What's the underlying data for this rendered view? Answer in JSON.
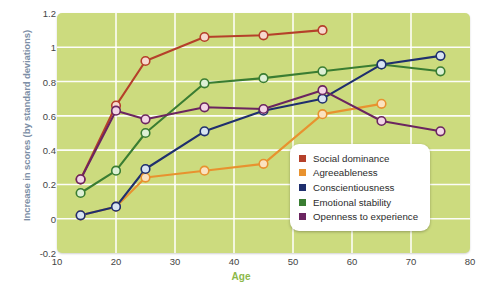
{
  "chart_data": {
    "type": "line",
    "title": "",
    "xlabel": "Age",
    "ylabel": "Increase in scores (by standard deviations)",
    "xlim": [
      10,
      80
    ],
    "ylim": [
      -0.2,
      1.2
    ],
    "xticks": [
      10,
      20,
      30,
      40,
      50,
      60,
      70,
      80
    ],
    "yticks": [
      -0.2,
      0,
      0.2,
      0.4,
      0.6,
      0.8,
      1,
      1.2
    ],
    "xtick_labels": [
      "10",
      "20",
      "30",
      "40",
      "50",
      "60",
      "70",
      "80"
    ],
    "ytick_labels": [
      "-0.2",
      "0",
      "0.2",
      "0.4",
      "0.6",
      "0.8",
      "1",
      "1.2"
    ],
    "grid": true,
    "grid_color": "#ffffff",
    "plot_background": "#ccdb7e",
    "legend_position": "bottom-right",
    "marker": "circle",
    "series": [
      {
        "name": "Social dominance",
        "color": "#b5402a",
        "marker_fill": "#f7d9cf",
        "x": [
          14,
          20,
          25,
          35,
          45,
          55
        ],
        "y": [
          0.23,
          0.66,
          0.92,
          1.06,
          1.07,
          1.1
        ]
      },
      {
        "name": "Agreeableness",
        "color": "#e8922f",
        "marker_fill": "#fbe2c0",
        "x": [
          14,
          20,
          25,
          35,
          45,
          55,
          65
        ],
        "y": [
          0.02,
          0.07,
          0.24,
          0.28,
          0.32,
          0.61,
          0.67
        ]
      },
      {
        "name": "Conscientiousness",
        "color": "#1f2f6e",
        "marker_fill": "#d8e4f2",
        "x": [
          14,
          20,
          25,
          35,
          45,
          55,
          65,
          75
        ],
        "y": [
          0.02,
          0.07,
          0.29,
          0.51,
          0.63,
          0.7,
          0.9,
          0.95
        ]
      },
      {
        "name": "Emotional stability",
        "color": "#3a7d32",
        "marker_fill": "#ddf0d5",
        "x": [
          14,
          20,
          25,
          35,
          45,
          55,
          65,
          75
        ],
        "y": [
          0.15,
          0.28,
          0.5,
          0.79,
          0.82,
          0.86,
          0.9,
          0.86
        ]
      },
      {
        "name": "Openness to experience",
        "color": "#6b2560",
        "marker_fill": "#f3d6e6",
        "x": [
          14,
          20,
          25,
          35,
          45,
          55,
          65,
          75
        ],
        "y": [
          0.23,
          0.63,
          0.58,
          0.65,
          0.64,
          0.75,
          0.57,
          0.51
        ]
      }
    ]
  },
  "legend": {
    "items": [
      {
        "label": "Social dominance",
        "color": "#b5402a"
      },
      {
        "label": "Agreeableness",
        "color": "#e8922f"
      },
      {
        "label": "Conscientiousness",
        "color": "#1f2f6e"
      },
      {
        "label": "Emotional stability",
        "color": "#3a7d32"
      },
      {
        "label": "Openness to experience",
        "color": "#6b2560"
      }
    ]
  }
}
